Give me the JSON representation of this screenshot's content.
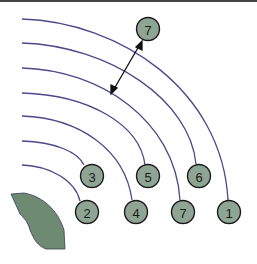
{
  "diagram": {
    "colors": {
      "arc": "#4a4a8a",
      "node_fill": "#8fa593",
      "node_stroke": "#1a1a1a",
      "shape_fill": "#6f8a73"
    },
    "nodes": [
      {
        "id": "top",
        "label": "7",
        "cx": 148,
        "cy": 29
      },
      {
        "id": "n3",
        "label": "3",
        "cx": 92,
        "cy": 176
      },
      {
        "id": "n5",
        "label": "5",
        "cx": 148,
        "cy": 176
      },
      {
        "id": "n6",
        "label": "6",
        "cx": 199,
        "cy": 176
      },
      {
        "id": "n2",
        "label": "2",
        "cx": 87,
        "cy": 212
      },
      {
        "id": "n4",
        "label": "4",
        "cx": 136,
        "cy": 212
      },
      {
        "id": "n7",
        "label": "7",
        "cx": 183,
        "cy": 212
      },
      {
        "id": "n1",
        "label": "1",
        "cx": 229,
        "cy": 212
      }
    ]
  }
}
